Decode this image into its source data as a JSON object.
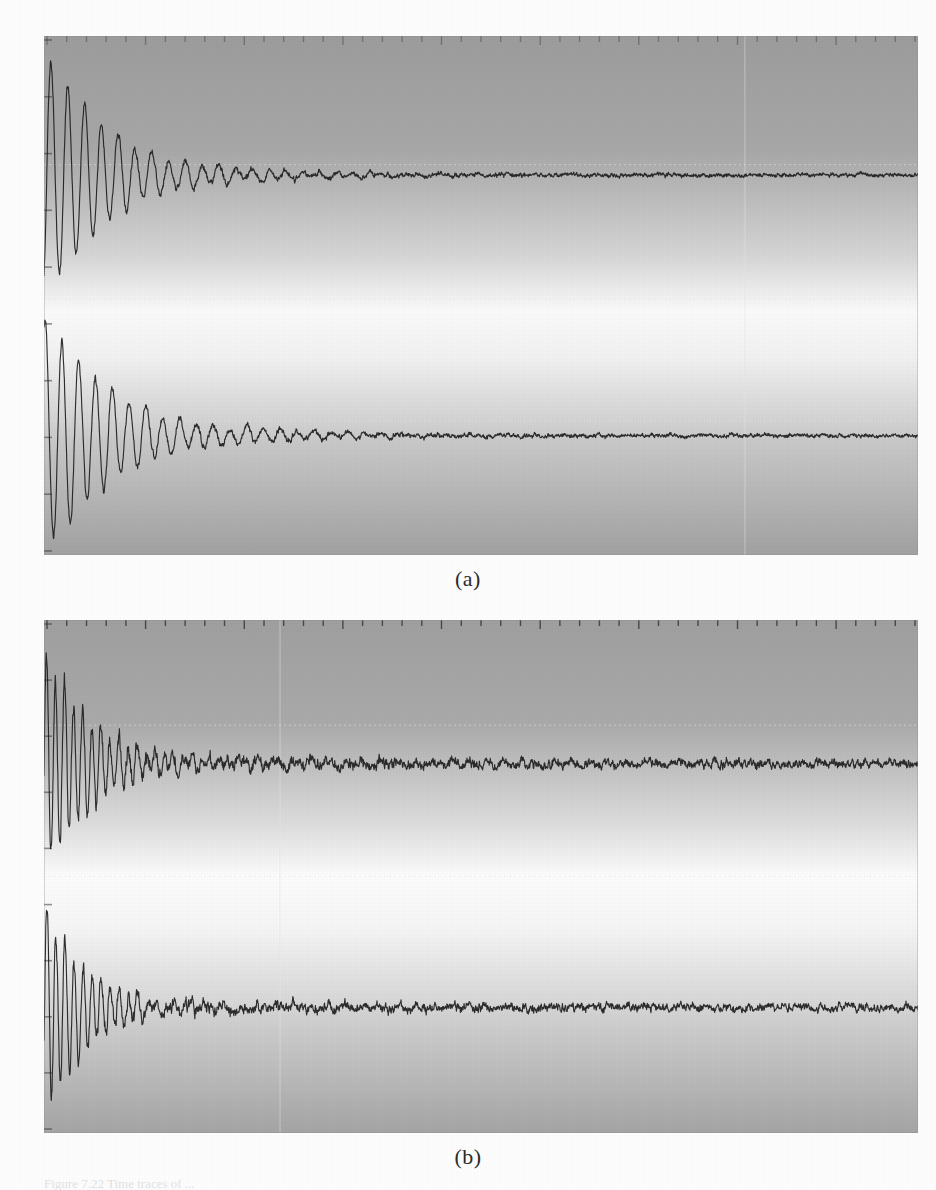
{
  "figure": {
    "subcaption_a": "(a)",
    "subcaption_b": "(b)",
    "caption": "Figure 7.22   Time traces of ..."
  },
  "style": {
    "trace_color": "#1e1e1e",
    "panel_dark": "#9a9a9a",
    "panel_light": "#fdfdfd",
    "gridline_color": "#e8e8e8",
    "tick_color": "#3a3a3a",
    "page_bg": "#ffffff"
  },
  "chart_data": {
    "type": "line",
    "title": "",
    "subtitle": "",
    "xlabel": "",
    "ylabel": "",
    "grid": true,
    "legend_position": "none",
    "axis_ranges": {
      "x": [
        0,
        1
      ],
      "y": [
        -1,
        1
      ]
    },
    "panels": [
      {
        "id": "a",
        "label": "(a)",
        "n_ticks_top": 44,
        "n_ticks_left": 9,
        "vertical_gridline_x_frac": [
          0.802
        ],
        "horizontal_gridline_y_frac": [
          0.248,
          0.507,
          0.742
        ],
        "traces": [
          {
            "name": "trace-a-upper",
            "baseline_y_frac": 0.268,
            "amplitude_frac": 0.235,
            "decay_tau_frac": 0.085,
            "frequency_cycles": 52,
            "noise_amp_frac": 0.012,
            "tail_amp_frac": 0.006,
            "seed": 11
          },
          {
            "name": "trace-a-lower",
            "baseline_y_frac": 0.77,
            "amplitude_frac": 0.225,
            "decay_tau_frac": 0.095,
            "frequency_cycles": 52,
            "noise_amp_frac": 0.012,
            "tail_amp_frac": 0.006,
            "seed": 29
          }
        ],
        "background_gradient_stops": [
          {
            "offset": 0.0,
            "color": "#9d9d9d"
          },
          {
            "offset": 0.22,
            "color": "#a8a8a8"
          },
          {
            "offset": 0.42,
            "color": "#d5d5d5"
          },
          {
            "offset": 0.53,
            "color": "#fbfbfb"
          },
          {
            "offset": 0.62,
            "color": "#f2f2f2"
          },
          {
            "offset": 0.78,
            "color": "#c9c9c9"
          },
          {
            "offset": 1.0,
            "color": "#a2a2a2"
          }
        ]
      },
      {
        "id": "b",
        "label": "(b)",
        "n_ticks_top": 44,
        "n_ticks_left": 9,
        "vertical_gridline_x_frac": [
          0.27
        ],
        "horizontal_gridline_y_frac": [
          0.205,
          0.5,
          0.7
        ],
        "traces": [
          {
            "name": "trace-b-upper",
            "baseline_y_frac": 0.28,
            "amplitude_frac": 0.21,
            "decay_tau_frac": 0.06,
            "frequency_cycles": 96,
            "noise_amp_frac": 0.03,
            "tail_amp_frac": 0.012,
            "seed": 7
          },
          {
            "name": "trace-b-lower",
            "baseline_y_frac": 0.755,
            "amplitude_frac": 0.195,
            "decay_tau_frac": 0.055,
            "frequency_cycles": 96,
            "noise_amp_frac": 0.03,
            "tail_amp_frac": 0.01,
            "seed": 53
          }
        ],
        "background_gradient_stops": [
          {
            "offset": 0.0,
            "color": "#a0a0a0"
          },
          {
            "offset": 0.2,
            "color": "#aaaaaa"
          },
          {
            "offset": 0.4,
            "color": "#dedede"
          },
          {
            "offset": 0.5,
            "color": "#fdfdfd"
          },
          {
            "offset": 0.6,
            "color": "#f6f6f6"
          },
          {
            "offset": 0.8,
            "color": "#cccccc"
          },
          {
            "offset": 1.0,
            "color": "#a5a5a5"
          }
        ]
      }
    ]
  }
}
